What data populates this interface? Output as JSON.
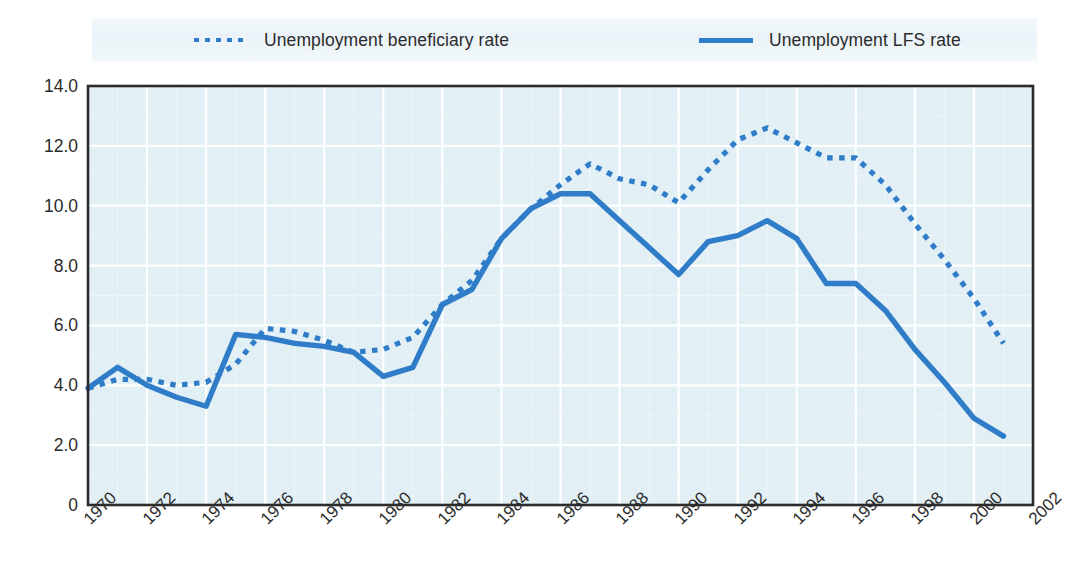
{
  "accent_color": "#2f7dc8",
  "plot_bg_color": "#e2eff5",
  "grid_color": "#ffffff",
  "frame_color": "#2b2b2b",
  "legend": {
    "items": [
      {
        "label": "Unemployment beneficiary rate",
        "style": "dotted",
        "swatch_name": "legend-swatch-dotted"
      },
      {
        "label": "Unemployment LFS rate",
        "style": "solid",
        "swatch_name": "legend-swatch-solid"
      }
    ]
  },
  "chart_data": {
    "type": "line",
    "title": "",
    "subtitle": "",
    "xlabel": "",
    "ylabel": "",
    "xlim": [
      1970,
      2002
    ],
    "ylim": [
      0,
      14
    ],
    "grid": true,
    "legend_position": "top",
    "ytick_labels": [
      "0",
      "2.0",
      "4.0",
      "6.0",
      "8.0",
      "10.0",
      "12.0",
      "14.0"
    ],
    "ytick_values": [
      0,
      2,
      4,
      6,
      8,
      10,
      12,
      14
    ],
    "xtick_labels": [
      "1970",
      "1972",
      "1974",
      "1976",
      "1978",
      "1980",
      "1982",
      "1984",
      "1986",
      "1988",
      "1990",
      "1992",
      "1994",
      "1996",
      "1998",
      "2000",
      "2002"
    ],
    "xtick_values": [
      1970,
      1972,
      1974,
      1976,
      1978,
      1980,
      1982,
      1984,
      1986,
      1988,
      1990,
      1992,
      1994,
      1996,
      1998,
      2000,
      2002
    ],
    "x": [
      1970,
      1971,
      1972,
      1973,
      1974,
      1975,
      1976,
      1977,
      1978,
      1979,
      1980,
      1981,
      1982,
      1983,
      1984,
      1985,
      1986,
      1987,
      1988,
      1989,
      1990,
      1991,
      1992,
      1993,
      1994,
      1995,
      1996,
      1997,
      1998,
      1999,
      2000,
      2001
    ],
    "series": [
      {
        "name": "Unemployment beneficiary rate",
        "style": "dotted",
        "values": [
          3.9,
          4.2,
          4.2,
          4.0,
          4.1,
          4.7,
          5.9,
          5.8,
          5.5,
          5.1,
          5.2,
          5.6,
          6.7,
          7.5,
          8.9,
          9.9,
          10.7,
          11.4,
          10.9,
          10.7,
          10.1,
          11.2,
          12.2,
          12.6,
          12.1,
          11.6,
          11.6,
          10.7,
          9.4,
          8.2,
          6.9,
          5.4
        ]
      },
      {
        "name": "Unemployment LFS rate",
        "style": "solid",
        "values": [
          3.9,
          4.6,
          4.0,
          3.6,
          3.3,
          5.7,
          5.6,
          5.4,
          5.3,
          5.1,
          4.3,
          4.6,
          6.7,
          7.2,
          8.9,
          9.9,
          10.4,
          10.4,
          9.5,
          8.6,
          7.7,
          8.8,
          9.0,
          9.5,
          8.9,
          7.4,
          7.4,
          6.5,
          5.2,
          4.1,
          2.9,
          2.3
        ]
      }
    ]
  }
}
